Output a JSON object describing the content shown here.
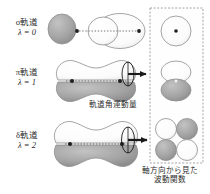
{
  "figure": {
    "title_alt": "molecular orbital angular momentum diagram",
    "background": "#ffffff"
  },
  "rows": [
    {
      "id": "sigma",
      "orbital_label": "σ軌道",
      "lambda_label": "λ = 0",
      "lambda_value": 0,
      "side_view": {
        "shape": "one-lobe-pair",
        "lobes": [
          {
            "position": "left-cap",
            "fill": "#9d9d9d",
            "sign": "-"
          },
          {
            "position": "right-body",
            "fill": "#fdfdfd",
            "sign": "+"
          }
        ],
        "axis_line": "dotted",
        "nuclei_dots": 2
      },
      "axial_view": {
        "cells": [
          {
            "fill": "#fdfdfd",
            "sign": "+"
          }
        ],
        "layout": "single-circle-with-center-dot",
        "center_dot": true
      },
      "has_rotation_arrow": false
    },
    {
      "id": "pi",
      "orbital_label": "π軌道",
      "lambda_label": "λ = 1",
      "lambda_value": 1,
      "side_view": {
        "shape": "two-lobe-pair",
        "lobes": [
          {
            "position": "upper",
            "fill": "#fdfdfd",
            "sign": "+"
          },
          {
            "position": "lower",
            "fill": "#9d9d9d",
            "sign": "-"
          }
        ],
        "axis_line": "dotted",
        "nuclei_dots": 2
      },
      "axial_view": {
        "cells": [
          {
            "fill": "#fdfdfd",
            "sign": "+"
          },
          {
            "fill": "#9d9d9d",
            "sign": "-"
          }
        ],
        "layout": "two-circles-stacked",
        "center_dot": true
      },
      "has_rotation_arrow": true
    },
    {
      "id": "delta",
      "orbital_label": "δ軌道",
      "lambda_label": "λ = 2",
      "lambda_value": 2,
      "side_view": {
        "shape": "four-lobe-pair",
        "lobes": [
          {
            "position": "upper",
            "fill": "#fdfdfd",
            "sign": "+"
          },
          {
            "position": "lower",
            "fill": "#9d9d9d",
            "sign": "-"
          }
        ],
        "axis_line": "dotted",
        "nuclei_dots": 2
      },
      "axial_view": {
        "cells": [
          {
            "fill": "#fdfdfd",
            "sign": "+"
          },
          {
            "fill": "#9d9d9d",
            "sign": "-"
          },
          {
            "fill": "#9d9d9d",
            "sign": "-"
          },
          {
            "fill": "#fdfdfd",
            "sign": "+"
          }
        ],
        "layout": "four-circles-quadrant",
        "center_dot": true
      },
      "has_rotation_arrow": true
    }
  ],
  "captions": {
    "angular_momentum": "軌道角運動量",
    "axial_wavefunction_line1": "軸方向から見た",
    "axial_wavefunction_line2": "波動関数"
  },
  "colors": {
    "lobe_positive": "#fdfdfd",
    "lobe_negative": "#9d9d9d",
    "outline": "#8e8e8e",
    "text": "#2b2b2b",
    "panel_border": "#9a9a9a",
    "arrow": "#1a1a1a"
  }
}
